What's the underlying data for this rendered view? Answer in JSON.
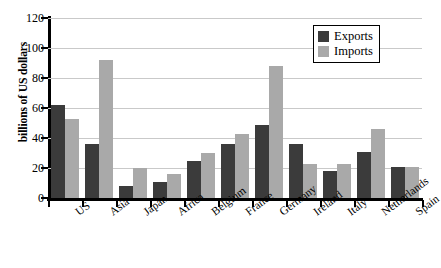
{
  "chart_data": {
    "type": "bar",
    "title": "",
    "xlabel": "",
    "ylabel": "billions of US dollars",
    "ylim": [
      0,
      120
    ],
    "yticks": [
      0,
      20,
      40,
      60,
      80,
      100,
      120
    ],
    "grid": true,
    "legend_position": "top-right",
    "categories": [
      "US",
      "Asia",
      "Japan",
      "Africa",
      "Belgium",
      "France",
      "Germany",
      "Ireland",
      "Italy",
      "Netherlands",
      "Spain"
    ],
    "series": [
      {
        "name": "Exports",
        "color": "#3b3b3b",
        "values": [
          62,
          36,
          8,
          11,
          25,
          36,
          49,
          36,
          18,
          31,
          21
        ]
      },
      {
        "name": "Imports",
        "color": "#a9a9a9",
        "values": [
          53,
          92,
          20,
          16,
          30,
          43,
          88,
          23,
          23,
          46,
          21
        ]
      }
    ]
  },
  "legend": {
    "items": [
      {
        "label": "Exports"
      },
      {
        "label": "Imports"
      }
    ]
  },
  "colors": {
    "exports": "#3b3b3b",
    "imports": "#a9a9a9",
    "gridline": "#c9c9c9",
    "axis": "#000000",
    "background": "#ffffff"
  }
}
